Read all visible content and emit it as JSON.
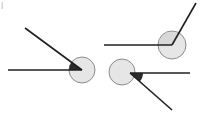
{
  "canvas": {
    "width": 199,
    "height": 114,
    "background": "#ffffff"
  },
  "style": {
    "ray_color": "#231f20",
    "ray_width": 1.6,
    "circle_fill": "#e6e6e6",
    "circle_stroke": "#8c8c8c",
    "circle_stroke_width": 1.0,
    "sector_dark_fill": "#2b2b2b",
    "sector_light_fill": "#d8d8d8",
    "artifact_color": "#d0d0d0"
  },
  "chart_data": {
    "type": "diagram",
    "title": "",
    "figures": [
      {
        "id": "figure-1",
        "label": "acute-angle-left",
        "vertex": [
          82,
          70
        ],
        "circle": {
          "cx": 82,
          "cy": 70,
          "r": 13
        },
        "sector_shade": "dark",
        "angle_degrees": 32,
        "rays": [
          {
            "name": "horizontal-ray",
            "from": [
              82,
              70
            ],
            "to": [
              8,
              70
            ],
            "direction_degrees": 180
          },
          {
            "name": "upper-left-ray",
            "from": [
              82,
              70
            ],
            "to": [
              25,
              28
            ],
            "direction_degrees": 144
          }
        ]
      },
      {
        "id": "figure-2",
        "label": "obtuse-angle-top-right",
        "vertex": [
          172,
          45
        ],
        "circle": {
          "cx": 172,
          "cy": 45,
          "r": 14
        },
        "sector_shade": "light",
        "angle_degrees": 122,
        "rays": [
          {
            "name": "horizontal-ray",
            "from": [
              172,
              45
            ],
            "to": [
              104,
              45
            ],
            "direction_degrees": 180
          },
          {
            "name": "upper-right-ray",
            "from": [
              172,
              45
            ],
            "to": [
              196,
              3
            ],
            "direction_degrees": 60
          }
        ]
      },
      {
        "id": "figure-3",
        "label": "acute-angle-bottom",
        "vertex": [
          130,
          73
        ],
        "circle": {
          "cx": 122,
          "cy": 72,
          "r": 13
        },
        "sector_shade": "dark",
        "angle_degrees": 38,
        "rays": [
          {
            "name": "horizontal-ray",
            "from": [
              130,
              73
            ],
            "to": [
              190,
              73
            ],
            "direction_degrees": 0
          },
          {
            "name": "lower-right-ray",
            "from": [
              130,
              73
            ],
            "to": [
              172,
              110
            ],
            "direction_degrees": -41
          }
        ]
      }
    ]
  }
}
